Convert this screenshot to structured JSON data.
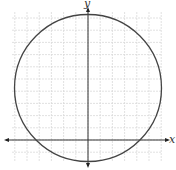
{
  "figure": {
    "type": "coordinate-plane-circle",
    "x_axis_label": "x",
    "y_axis_label": "y",
    "grid": true,
    "grid_spacing_px": 12.2,
    "grid_color": "#d9d9d9",
    "axis_color": "#333333",
    "circle_color": "#444444",
    "origin_px": {
      "x": 88,
      "y": 140
    },
    "circle_center_px": {
      "x": 88,
      "y": 88
    },
    "circle_radius_px": 74,
    "grid_bounds_px": {
      "left": 12,
      "top": 12,
      "right": 162,
      "bottom": 162
    }
  }
}
